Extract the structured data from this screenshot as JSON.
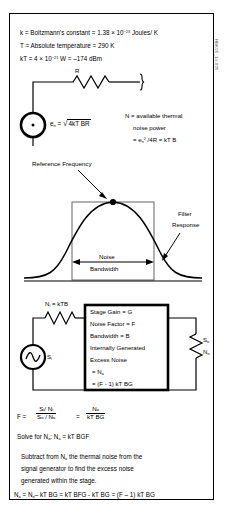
{
  "figure": {
    "id_watermark": "HBK05_14-005"
  },
  "definitions": [
    {
      "id": "k",
      "text": "k = Boltzmann's constant = 1.38 × 10",
      "sup": "−23",
      "tail": " Joules/ K"
    },
    {
      "id": "T",
      "text": "T = Absolute temperature = 290 K",
      "sup": "",
      "tail": ""
    },
    {
      "id": "kT",
      "text": "kT = 4 × 10",
      "sup": "−21",
      "tail": "  W = –174 dBm"
    }
  ],
  "circuit_top": {
    "resistor_label": "R",
    "source_label_base": "e",
    "source_label_sub": "n",
    "source_equals": " = ",
    "source_radicand": "4kT BR",
    "note_line1": "N = available thermal",
    "note_line2": "noise power",
    "note_line3_pre": "= e",
    "note_line3_sub": "n",
    "note_line3_sup": "2",
    "note_line3_post": " /4R = kT B"
  },
  "filter_plot": {
    "reference_frequency_label": "Reference Frequency",
    "filter_response_label_line1": "Filter",
    "filter_response_label_line2": "Response",
    "noise_bandwidth_line1": "Noise",
    "noise_bandwidth_line2": "Bandwidth"
  },
  "stage_diagram": {
    "input_noise_label_pre": "N",
    "input_noise_label_sub": "i",
    "input_noise_label_post": " = kTB",
    "source_label_pre": "S",
    "source_label_sub": "i",
    "box_lines": [
      "Stage Gain = G",
      "Noise Factor = F",
      "Bandwidth = B",
      "Internally Generated",
      "Excess Noise"
    ],
    "box_line_na_pre": " = N",
    "box_line_na_sub": "a",
    "box_line_last": " = (F - 1) kT BG",
    "output_s_pre": "S",
    "output_s_sub": "o",
    "output_n_pre": "N",
    "output_n_sub": "o"
  },
  "equations": {
    "f_symbol": "F  =",
    "frac1_num": "Sᵢ/ Nᵢ",
    "frac1_den": "Sₒ / Nₒ",
    "equals": "=",
    "frac2_num": "Nₒ",
    "frac2_den": "kT BG",
    "solve_line_pre": "Solve for N",
    "solve_line_sub": "o",
    "solve_line_post": ":  N",
    "solve_line_sub2": "o",
    "solve_line_tail": " = kT BGF",
    "subtract_line1_pre": "Subtract from N",
    "subtract_line1_sub": "o",
    "subtract_line1_post": " the thermal noise from the",
    "subtract_line2": "signal generator to find the excess noise",
    "subtract_line3": "generated within the stage.",
    "final_pre": "N",
    "final_sub_a": "a",
    "final_mid1": " = N",
    "final_sub_o": "o",
    "final_tail": "– kT BG = kT BFG - kT BG = (F – 1) kT BG"
  },
  "colors": {
    "ink": "#000000",
    "page": "#ffffff",
    "thin_line": "#333333"
  }
}
